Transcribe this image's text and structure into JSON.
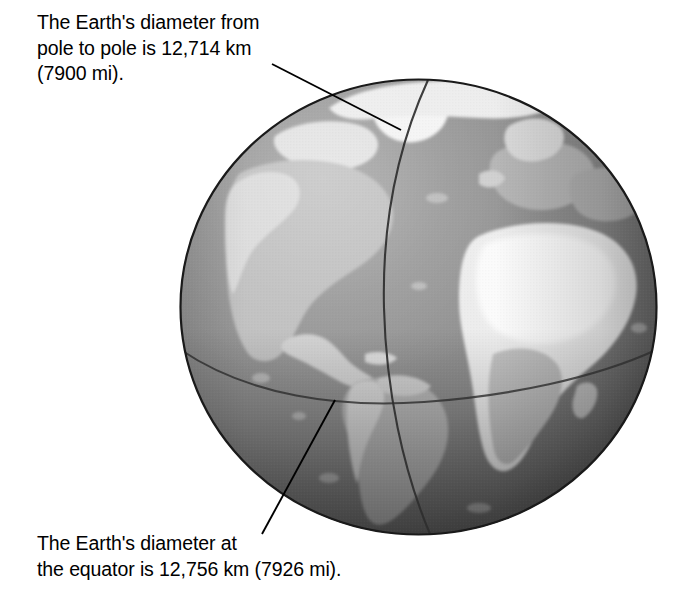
{
  "figure": {
    "width": 694,
    "height": 592,
    "background": "#ffffff"
  },
  "captions": {
    "top": {
      "text": "The Earth's diameter from\npole to pole is 12,714 km\n(7900 mi).",
      "measurement_km": "12,714 km",
      "measurement_mi": "7900 mi",
      "describes": "polar diameter"
    },
    "bottom": {
      "text": "The Earth's diameter at\nthe equator is 12,756 km (7926 mi).",
      "measurement_km": "12,756 km",
      "measurement_mi": "7926 mi",
      "describes": "equatorial diameter"
    }
  },
  "globe": {
    "label": "Earth globe",
    "view": "Atlantic-centered",
    "visible_landmasses": [
      "North America",
      "Greenland",
      "South America",
      "Europe",
      "Africa"
    ],
    "grid_lines": [
      {
        "name": "prime-meridian",
        "label": "meridian"
      },
      {
        "name": "equator",
        "label": "equator"
      }
    ],
    "colors": {
      "outline": "#1a1a1a",
      "ocean_light": "#9a9a9a",
      "ocean_mid": "#8a8a8a",
      "ocean_dark": "#6a6a6a",
      "ocean_shadow": "#4a4a4a",
      "land_bright": "#f0f0f0",
      "land_mid": "#c8c8c8",
      "land_dim": "#a8a8a8",
      "grid_line": "#3a3a3a",
      "leader_line": "#000000"
    },
    "geometry": {
      "left": 179,
      "top": 78,
      "width": 479,
      "height": 458
    }
  },
  "leader_lines": [
    {
      "name": "leader-line-polar",
      "from": [
        272,
        64
      ],
      "to": [
        401,
        130
      ],
      "connects": "top caption to north polar axis"
    },
    {
      "name": "leader-line-equatorial",
      "from": [
        262,
        534
      ],
      "to": [
        335,
        400
      ],
      "connects": "bottom caption to equator line"
    }
  ]
}
